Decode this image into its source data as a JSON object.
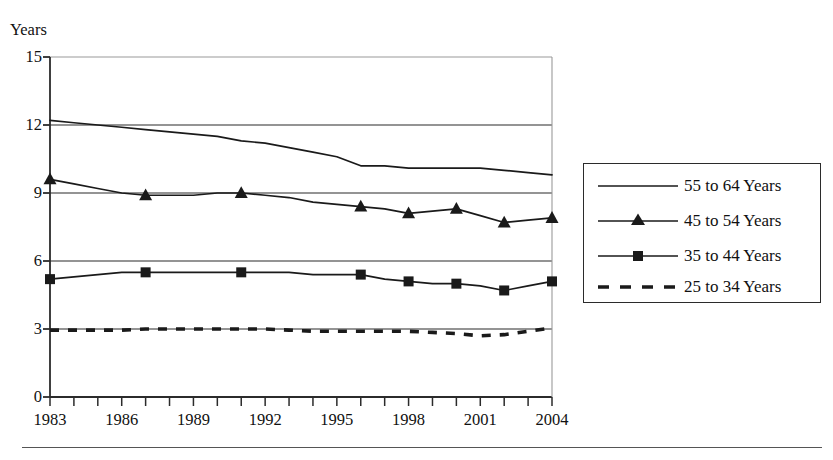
{
  "chart_data": {
    "type": "line",
    "title": "",
    "subtitle": "",
    "xlabel": "",
    "ylabel": "Years",
    "ylim": [
      0,
      15
    ],
    "xlim": [
      1983,
      2004
    ],
    "ytick_values": [
      0,
      3,
      6,
      9,
      12,
      15
    ],
    "ytick_labels": [
      "0",
      "3",
      "6",
      "9",
      "12",
      "15"
    ],
    "xtick_labels": [
      "1983",
      "1986",
      "1989",
      "1992",
      "1995",
      "1998",
      "2001",
      "2004"
    ],
    "xtick_values": [
      1983,
      1986,
      1989,
      1992,
      1995,
      1998,
      2001,
      2004
    ],
    "x_minor_tick_interval": 1,
    "grid": "horizontal",
    "legend_position": "right",
    "x": [
      1983,
      1984,
      1985,
      1986,
      1987,
      1988,
      1989,
      1990,
      1991,
      1992,
      1993,
      1994,
      1995,
      1996,
      1997,
      1998,
      1999,
      2000,
      2001,
      2002,
      2003,
      2004
    ],
    "series": [
      {
        "name": "55 to 64 Years",
        "marker": "none",
        "dash": "solid",
        "color": "#1a1a1a",
        "values": [
          12.2,
          12.1,
          12.0,
          11.9,
          11.8,
          11.7,
          11.6,
          11.5,
          11.3,
          11.2,
          11.0,
          10.8,
          10.6,
          10.2,
          10.2,
          10.1,
          10.1,
          10.1,
          10.1,
          10.0,
          9.9,
          9.8
        ]
      },
      {
        "name": "45 to 54 Years",
        "marker": "triangle",
        "dash": "solid",
        "color": "#1a1a1a",
        "values": [
          9.6,
          9.4,
          9.2,
          9.0,
          8.9,
          8.9,
          8.9,
          9.0,
          9.0,
          8.9,
          8.8,
          8.6,
          8.5,
          8.4,
          8.3,
          8.1,
          8.2,
          8.3,
          8.0,
          7.7,
          7.8,
          7.9
        ],
        "marker_years": [
          1983,
          1987,
          1991,
          1996,
          1998,
          2000,
          2002,
          2004
        ],
        "marker_values": [
          9.6,
          8.9,
          9.0,
          8.4,
          8.1,
          8.3,
          7.7,
          7.9
        ]
      },
      {
        "name": "35 to 44 Years",
        "marker": "square",
        "dash": "solid",
        "color": "#1a1a1a",
        "values": [
          5.2,
          5.3,
          5.4,
          5.5,
          5.5,
          5.5,
          5.5,
          5.5,
          5.5,
          5.5,
          5.5,
          5.4,
          5.4,
          5.4,
          5.2,
          5.1,
          5.0,
          5.0,
          4.9,
          4.7,
          4.9,
          5.1
        ],
        "marker_years": [
          1983,
          1987,
          1991,
          1996,
          1998,
          2000,
          2002,
          2004
        ],
        "marker_values": [
          5.2,
          5.5,
          5.5,
          5.4,
          5.1,
          5.0,
          4.7,
          5.1
        ]
      },
      {
        "name": "25 to 34 Years",
        "marker": "none",
        "dash": "dashed",
        "color": "#1a1a1a",
        "values": [
          2.95,
          2.95,
          2.95,
          2.95,
          3.0,
          3.0,
          3.0,
          3.0,
          3.0,
          3.0,
          2.95,
          2.9,
          2.9,
          2.9,
          2.9,
          2.9,
          2.85,
          2.8,
          2.7,
          2.75,
          2.9,
          3.05
        ]
      }
    ]
  },
  "axis": {
    "y_title": "Years"
  },
  "legend": {
    "entries": [
      {
        "label": "55 to 64 Years",
        "sample": "solid-line"
      },
      {
        "label": "45 to 54 Years",
        "sample": "solid-line-triangle-marker"
      },
      {
        "label": "35 to 44 Years",
        "sample": "solid-line-square-marker"
      },
      {
        "label": "25 to 34 Years",
        "sample": "dashed-line"
      }
    ]
  }
}
